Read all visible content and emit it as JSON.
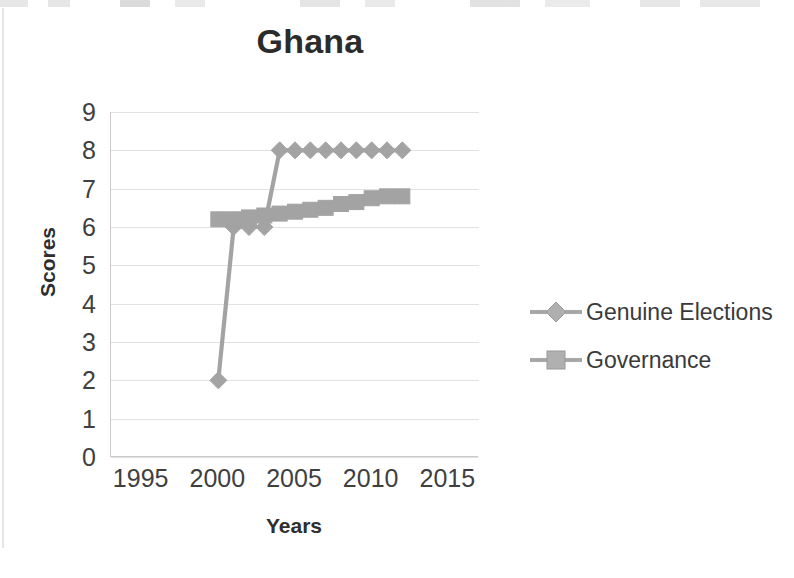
{
  "chart_data": {
    "type": "line",
    "title": "Ghana",
    "xlabel": "Years",
    "ylabel": "Scores",
    "xlim": [
      1993,
      2017
    ],
    "ylim": [
      0,
      9
    ],
    "xticks": [
      "1995",
      "2000",
      "2005",
      "2010",
      "2015"
    ],
    "yticks": [
      "0",
      "1",
      "2",
      "3",
      "4",
      "5",
      "6",
      "7",
      "8",
      "9"
    ],
    "grid": "horizontal",
    "legend_position": "right",
    "x": [
      2000,
      2001,
      2002,
      2003,
      2004,
      2005,
      2006,
      2007,
      2008,
      2009,
      2010,
      2011,
      2012
    ],
    "series": [
      {
        "name": "Genuine Elections",
        "marker": "diamond",
        "color": "#a3a3a3",
        "values": [
          2,
          6,
          6,
          6,
          8,
          8,
          8,
          8,
          8,
          8,
          8,
          8,
          8
        ]
      },
      {
        "name": "Governance",
        "marker": "square",
        "color": "#a3a3a3",
        "values": [
          6.2,
          6.2,
          6.25,
          6.3,
          6.35,
          6.4,
          6.45,
          6.5,
          6.6,
          6.65,
          6.75,
          6.8,
          6.8
        ]
      }
    ]
  },
  "legend": {
    "items": [
      {
        "label": "Genuine Elections",
        "marker": "diamond"
      },
      {
        "label": "Governance",
        "marker": "square"
      }
    ]
  },
  "axes": {
    "y_ticks": [
      "9",
      "8",
      "7",
      "6",
      "5",
      "4",
      "3",
      "2",
      "1",
      "0"
    ],
    "x_ticks": [
      "1995",
      "2000",
      "2005",
      "2010",
      "2015"
    ]
  },
  "colors": {
    "series": "#a3a3a3",
    "grid": "#e2e2e2",
    "axis": "#c9c9c9",
    "title": "#2b2b2b",
    "text": "#3f3f3f"
  }
}
